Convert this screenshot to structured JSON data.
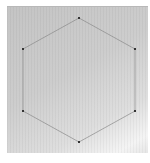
{
  "diagram": {
    "shape": "regular-hexagon",
    "background_color": "#cccccc",
    "stroke_color": "#8a8a8a",
    "vertex_color": "#333333",
    "vertices": [
      {
        "name": "top",
        "x": 79,
        "y": 18
      },
      {
        "name": "upper-right",
        "x": 135,
        "y": 49
      },
      {
        "name": "lower-right",
        "x": 135,
        "y": 111
      },
      {
        "name": "bottom",
        "x": 79,
        "y": 142
      },
      {
        "name": "lower-left",
        "x": 23,
        "y": 111
      },
      {
        "name": "upper-left",
        "x": 23,
        "y": 49
      }
    ]
  },
  "caption": {
    "text": ""
  }
}
